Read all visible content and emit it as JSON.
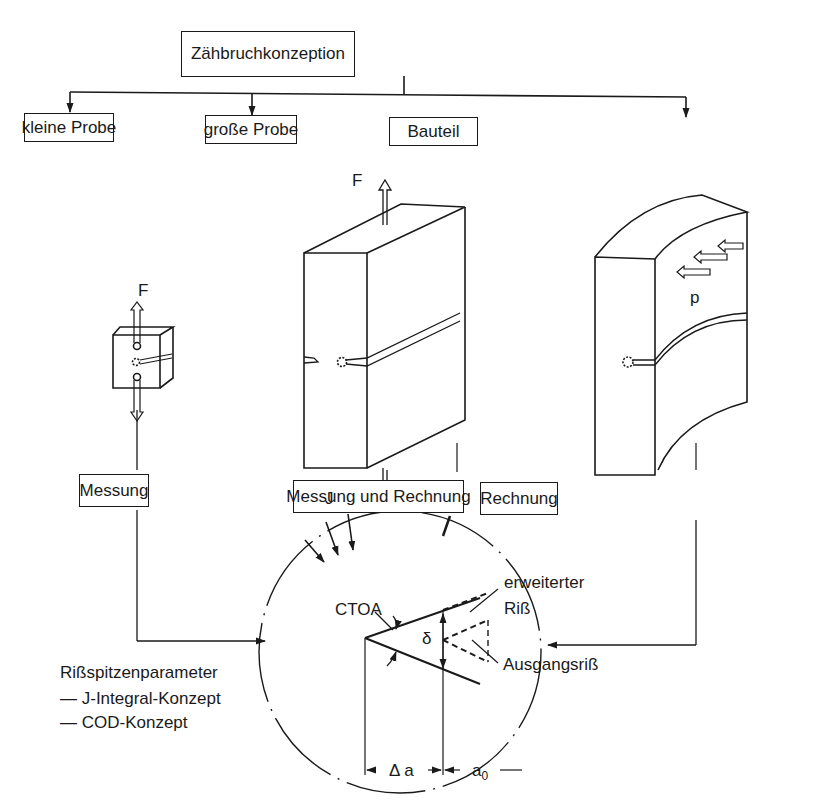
{
  "title": "Zähbruchkonzeption",
  "branches": [
    {
      "label": "kleine Probe"
    },
    {
      "label": "große Probe"
    },
    {
      "label": "Bauteil"
    }
  ],
  "methods": [
    {
      "label": "Messung"
    },
    {
      "label": "Messung und Rechnung"
    },
    {
      "label": "Rechnung"
    }
  ],
  "symbols": {
    "force_small": "F",
    "force_large": "F",
    "pressure": "p",
    "j_integral": "J",
    "ctoa": "CTOA",
    "delta": "δ",
    "delta_a": "Δ a",
    "a0": "a",
    "a0_sub": "0"
  },
  "crack_labels": {
    "extended_line1": "erweiterter",
    "extended_line2": "Riß",
    "initial": "Ausgangsriß"
  },
  "parameters": {
    "heading": "Rißspitzenparameter",
    "items": [
      "— J-Integral-Konzept",
      "— COD-Konzept"
    ]
  }
}
